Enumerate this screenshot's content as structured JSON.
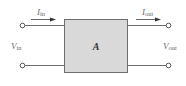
{
  "diagram": {
    "block": {
      "label": "A",
      "fill": "#d9d9d9",
      "stroke": "#6e6e6e"
    },
    "input": {
      "current": {
        "symbol": "I",
        "subscript": "in"
      },
      "voltage": {
        "symbol": "V",
        "subscript": "in"
      }
    },
    "output": {
      "current": {
        "symbol": "I",
        "subscript": "out"
      },
      "voltage": {
        "symbol": "V",
        "subscript": "out"
      }
    },
    "colors": {
      "wire": "#6e6e6e",
      "text": "#6a6a6a",
      "arrow": "#333333"
    }
  }
}
